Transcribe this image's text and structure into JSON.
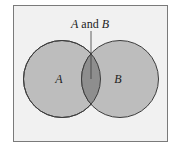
{
  "diagram": {
    "type": "venn",
    "sets": [
      {
        "id": "A",
        "label": "A"
      },
      {
        "id": "B",
        "label": "B"
      }
    ],
    "intersection": {
      "label_parts": [
        "A",
        " and ",
        "B"
      ]
    },
    "colors": {
      "background": "#f1f1f1",
      "border": "#7a7a7a",
      "circle_fill": "#bdbdbd",
      "intersection_fill": "#8e8e8e",
      "stroke": "#3c3c3c"
    }
  }
}
